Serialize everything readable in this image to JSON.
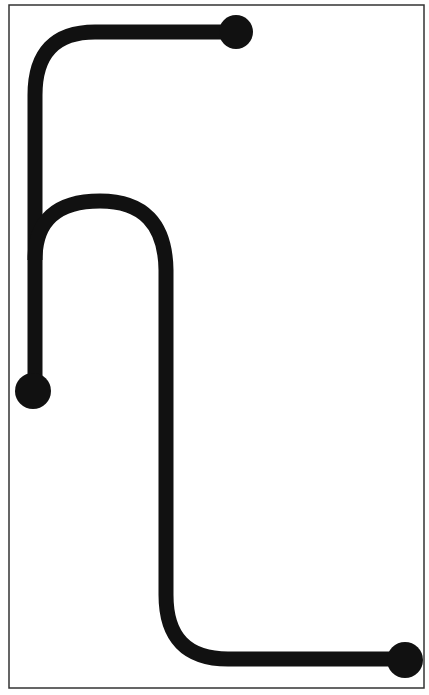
{
  "diagram": {
    "type": "track-path",
    "background": "#ffffff",
    "frame": {
      "x": 9,
      "y": 5,
      "width": 415,
      "height": 683,
      "stroke": "#333333",
      "stroke_width": 1.5
    },
    "path": {
      "stroke": "#111111",
      "stroke_width": 15,
      "segments": [
        {
          "name": "top-arm",
          "d": "M 236 32 L 95 32 Q 35 32 35 95 L 35 391"
        },
        {
          "name": "arch-and-descent",
          "d": "M 35 260 Q 35 201 100 201 Q 165 201 166 270 L 166 595 Q 166 659 228 659 L 405 659"
        }
      ]
    },
    "endpoints": [
      {
        "name": "top-endpoint",
        "cx": 236,
        "cy": 32,
        "r": 17
      },
      {
        "name": "left-endpoint",
        "cx": 33,
        "cy": 391,
        "r": 18
      },
      {
        "name": "bottom-right-endpoint",
        "cx": 405,
        "cy": 660,
        "r": 18
      }
    ],
    "color": "#111111"
  }
}
